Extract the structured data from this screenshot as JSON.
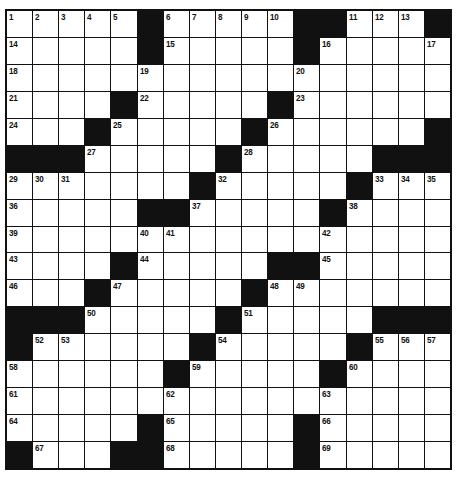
{
  "puzzle": {
    "rows": 17,
    "cols": 17,
    "colors": {
      "black": "#111111",
      "white": "#ffffff",
      "grid_line": "#111111"
    },
    "black_cells": [
      [
        0,
        5
      ],
      [
        0,
        11
      ],
      [
        0,
        12
      ],
      [
        0,
        16
      ],
      [
        1,
        5
      ],
      [
        1,
        11
      ],
      [
        3,
        4
      ],
      [
        3,
        10
      ],
      [
        4,
        3
      ],
      [
        4,
        9
      ],
      [
        4,
        16
      ],
      [
        5,
        0
      ],
      [
        5,
        1
      ],
      [
        5,
        2
      ],
      [
        5,
        8
      ],
      [
        5,
        14
      ],
      [
        5,
        15
      ],
      [
        5,
        16
      ],
      [
        6,
        7
      ],
      [
        6,
        13
      ],
      [
        7,
        5
      ],
      [
        7,
        6
      ],
      [
        7,
        12
      ],
      [
        9,
        4
      ],
      [
        9,
        10
      ],
      [
        9,
        11
      ],
      [
        10,
        3
      ],
      [
        10,
        9
      ],
      [
        11,
        0
      ],
      [
        11,
        1
      ],
      [
        11,
        2
      ],
      [
        11,
        8
      ],
      [
        11,
        14
      ],
      [
        11,
        15
      ],
      [
        11,
        16
      ],
      [
        12,
        0
      ],
      [
        12,
        7
      ],
      [
        12,
        13
      ],
      [
        13,
        6
      ],
      [
        13,
        12
      ],
      [
        15,
        5
      ],
      [
        15,
        11
      ],
      [
        16,
        0
      ],
      [
        16,
        4
      ],
      [
        16,
        5
      ],
      [
        16,
        11
      ]
    ],
    "numbers": [
      {
        "r": 0,
        "c": 0,
        "n": "1"
      },
      {
        "r": 0,
        "c": 1,
        "n": "2"
      },
      {
        "r": 0,
        "c": 2,
        "n": "3"
      },
      {
        "r": 0,
        "c": 3,
        "n": "4"
      },
      {
        "r": 0,
        "c": 4,
        "n": "5"
      },
      {
        "r": 0,
        "c": 6,
        "n": "6"
      },
      {
        "r": 0,
        "c": 7,
        "n": "7"
      },
      {
        "r": 0,
        "c": 8,
        "n": "8"
      },
      {
        "r": 0,
        "c": 9,
        "n": "9"
      },
      {
        "r": 0,
        "c": 10,
        "n": "10"
      },
      {
        "r": 0,
        "c": 13,
        "n": "11"
      },
      {
        "r": 0,
        "c": 14,
        "n": "12"
      },
      {
        "r": 0,
        "c": 15,
        "n": "13"
      },
      {
        "r": 1,
        "c": 0,
        "n": "14"
      },
      {
        "r": 1,
        "c": 6,
        "n": "15"
      },
      {
        "r": 1,
        "c": 12,
        "n": "16"
      },
      {
        "r": 1,
        "c": 16,
        "n": "17"
      },
      {
        "r": 2,
        "c": 0,
        "n": "18"
      },
      {
        "r": 2,
        "c": 5,
        "n": "19"
      },
      {
        "r": 2,
        "c": 11,
        "n": "20"
      },
      {
        "r": 3,
        "c": 0,
        "n": "21"
      },
      {
        "r": 3,
        "c": 5,
        "n": "22"
      },
      {
        "r": 3,
        "c": 11,
        "n": "23"
      },
      {
        "r": 4,
        "c": 0,
        "n": "24"
      },
      {
        "r": 4,
        "c": 4,
        "n": "25"
      },
      {
        "r": 4,
        "c": 10,
        "n": "26"
      },
      {
        "r": 5,
        "c": 3,
        "n": "27"
      },
      {
        "r": 5,
        "c": 9,
        "n": "28"
      },
      {
        "r": 6,
        "c": 0,
        "n": "29"
      },
      {
        "r": 6,
        "c": 1,
        "n": "30"
      },
      {
        "r": 6,
        "c": 2,
        "n": "31"
      },
      {
        "r": 6,
        "c": 8,
        "n": "32"
      },
      {
        "r": 6,
        "c": 14,
        "n": "33"
      },
      {
        "r": 6,
        "c": 15,
        "n": "34"
      },
      {
        "r": 6,
        "c": 16,
        "n": "35"
      },
      {
        "r": 7,
        "c": 0,
        "n": "36"
      },
      {
        "r": 7,
        "c": 7,
        "n": "37"
      },
      {
        "r": 7,
        "c": 13,
        "n": "38"
      },
      {
        "r": 8,
        "c": 0,
        "n": "39"
      },
      {
        "r": 8,
        "c": 5,
        "n": "40"
      },
      {
        "r": 8,
        "c": 6,
        "n": "41"
      },
      {
        "r": 8,
        "c": 12,
        "n": "42"
      },
      {
        "r": 9,
        "c": 0,
        "n": "43"
      },
      {
        "r": 9,
        "c": 5,
        "n": "44"
      },
      {
        "r": 9,
        "c": 12,
        "n": "45"
      },
      {
        "r": 10,
        "c": 0,
        "n": "46"
      },
      {
        "r": 10,
        "c": 4,
        "n": "47"
      },
      {
        "r": 10,
        "c": 10,
        "n": "48"
      },
      {
        "r": 10,
        "c": 11,
        "n": "49"
      },
      {
        "r": 11,
        "c": 3,
        "n": "50"
      },
      {
        "r": 11,
        "c": 9,
        "n": "51"
      },
      {
        "r": 12,
        "c": 1,
        "n": "52"
      },
      {
        "r": 12,
        "c": 2,
        "n": "53"
      },
      {
        "r": 12,
        "c": 8,
        "n": "54"
      },
      {
        "r": 12,
        "c": 14,
        "n": "55"
      },
      {
        "r": 12,
        "c": 15,
        "n": "56"
      },
      {
        "r": 12,
        "c": 16,
        "n": "57"
      },
      {
        "r": 13,
        "c": 0,
        "n": "58"
      },
      {
        "r": 13,
        "c": 7,
        "n": "59"
      },
      {
        "r": 13,
        "c": 13,
        "n": "60"
      },
      {
        "r": 14,
        "c": 0,
        "n": "61"
      },
      {
        "r": 14,
        "c": 6,
        "n": "62"
      },
      {
        "r": 14,
        "c": 12,
        "n": "63"
      },
      {
        "r": 15,
        "c": 0,
        "n": "64"
      },
      {
        "r": 15,
        "c": 6,
        "n": "65"
      },
      {
        "r": 15,
        "c": 12,
        "n": "66"
      },
      {
        "r": 16,
        "c": 1,
        "n": "67"
      },
      {
        "r": 16,
        "c": 6,
        "n": "68"
      },
      {
        "r": 16,
        "c": 12,
        "n": "69"
      }
    ],
    "entries": {}
  }
}
